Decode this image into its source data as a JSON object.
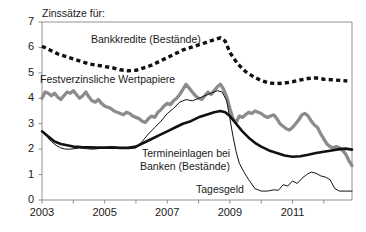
{
  "chart_data": {
    "type": "line",
    "title": "Zinssätze für:",
    "xlabel": "",
    "ylabel": "",
    "xlim": [
      2003.0,
      2012.9
    ],
    "ylim": [
      0,
      7
    ],
    "yticks": [
      0,
      1,
      2,
      3,
      4,
      5,
      6,
      7
    ],
    "xticks": [
      2003,
      2004,
      2005,
      2006,
      2007,
      2008,
      2009,
      2010,
      2011,
      2012
    ],
    "xtick_labels": [
      "2003",
      "",
      "2005",
      "",
      "2007",
      "",
      "2009",
      "",
      "2011",
      ""
    ],
    "grid": false,
    "legend_position": "inline-annotations",
    "colors": {
      "bankkredite": "#111111",
      "wertpapiere": "#8c8c8c",
      "termineinlagen": "#111111",
      "tagesgeld": "#111111",
      "axis": "#777777",
      "text": "#1a1a1a"
    },
    "series": [
      {
        "name": "Bankkredite (Bestände)",
        "style": "dashed-thick",
        "color": "#111111",
        "x": [
          2003.0,
          2003.25,
          2003.5,
          2003.75,
          2004.0,
          2004.25,
          2004.5,
          2004.75,
          2005.0,
          2005.25,
          2005.5,
          2005.75,
          2006.0,
          2006.25,
          2006.5,
          2006.75,
          2007.0,
          2007.25,
          2007.5,
          2007.75,
          2008.0,
          2008.25,
          2008.5,
          2008.7,
          2008.85,
          2009.0,
          2009.25,
          2009.5,
          2009.75,
          2010.0,
          2010.25,
          2010.5,
          2010.75,
          2011.0,
          2011.25,
          2011.5,
          2011.75,
          2012.0,
          2012.35,
          2012.75
        ],
        "y": [
          6.05,
          5.9,
          5.75,
          5.65,
          5.55,
          5.45,
          5.35,
          5.3,
          5.25,
          5.2,
          5.12,
          5.08,
          5.1,
          5.2,
          5.3,
          5.45,
          5.6,
          5.75,
          5.9,
          6.0,
          6.1,
          6.2,
          6.3,
          6.38,
          6.25,
          5.8,
          5.35,
          5.05,
          4.85,
          4.7,
          4.6,
          4.58,
          4.6,
          4.65,
          4.72,
          4.78,
          4.8,
          4.75,
          4.72,
          4.68
        ]
      },
      {
        "name": "Festverzinsliche Wertpapiere",
        "style": "solid-thick-gray",
        "color": "#8c8c8c",
        "x": [
          2003.0,
          2003.1,
          2003.2,
          2003.3,
          2003.4,
          2003.5,
          2003.6,
          2003.7,
          2003.8,
          2003.9,
          2004.0,
          2004.1,
          2004.2,
          2004.3,
          2004.4,
          2004.5,
          2004.6,
          2004.7,
          2004.8,
          2004.9,
          2005.0,
          2005.1,
          2005.2,
          2005.3,
          2005.4,
          2005.5,
          2005.6,
          2005.7,
          2005.8,
          2005.9,
          2006.0,
          2006.1,
          2006.2,
          2006.3,
          2006.4,
          2006.5,
          2006.6,
          2006.7,
          2006.8,
          2006.9,
          2007.0,
          2007.1,
          2007.2,
          2007.3,
          2007.4,
          2007.5,
          2007.6,
          2007.7,
          2007.8,
          2007.9,
          2008.0,
          2008.1,
          2008.2,
          2008.3,
          2008.4,
          2008.5,
          2008.6,
          2008.7,
          2008.8,
          2008.9,
          2009.0,
          2009.1,
          2009.2,
          2009.3,
          2009.4,
          2009.5,
          2009.6,
          2009.7,
          2009.8,
          2009.9,
          2010.0,
          2010.1,
          2010.2,
          2010.3,
          2010.4,
          2010.5,
          2010.6,
          2010.7,
          2010.8,
          2010.9,
          2011.0,
          2011.1,
          2011.2,
          2011.3,
          2011.4,
          2011.5,
          2011.6,
          2011.7,
          2011.8,
          2011.9,
          2012.0,
          2012.1,
          2012.2,
          2012.3,
          2012.4,
          2012.5,
          2012.6,
          2012.7,
          2012.8,
          2012.9
        ],
        "y": [
          4.0,
          4.25,
          4.2,
          4.1,
          4.2,
          4.05,
          3.95,
          4.1,
          4.25,
          4.2,
          4.3,
          4.15,
          4.0,
          4.1,
          4.25,
          4.05,
          3.9,
          3.85,
          3.95,
          3.8,
          3.7,
          3.65,
          3.6,
          3.5,
          3.45,
          3.4,
          3.35,
          3.45,
          3.4,
          3.3,
          3.25,
          3.2,
          3.1,
          3.05,
          3.2,
          3.3,
          3.25,
          3.45,
          3.55,
          3.7,
          3.8,
          3.75,
          3.9,
          4.0,
          4.15,
          4.35,
          4.55,
          4.4,
          4.25,
          4.1,
          4.0,
          3.95,
          4.1,
          4.25,
          4.15,
          4.3,
          4.45,
          4.55,
          4.35,
          4.05,
          3.6,
          3.2,
          3.05,
          3.3,
          3.25,
          3.35,
          3.45,
          3.4,
          3.5,
          3.45,
          3.4,
          3.3,
          3.25,
          3.3,
          3.35,
          3.2,
          3.0,
          2.9,
          2.8,
          2.75,
          2.85,
          3.0,
          3.15,
          3.35,
          3.4,
          3.3,
          3.1,
          2.95,
          2.85,
          2.6,
          2.4,
          2.2,
          2.1,
          2.05,
          2.1,
          2.05,
          1.95,
          1.8,
          1.55,
          1.35
        ]
      },
      {
        "name": "Termineinlagen bei Banken (Bestände)",
        "style": "solid-thick-black",
        "color": "#111111",
        "x": [
          2003.0,
          2003.2,
          2003.4,
          2003.6,
          2003.8,
          2004.0,
          2004.25,
          2004.5,
          2004.75,
          2005.0,
          2005.25,
          2005.5,
          2005.75,
          2006.0,
          2006.25,
          2006.5,
          2006.75,
          2007.0,
          2007.25,
          2007.5,
          2007.75,
          2008.0,
          2008.25,
          2008.5,
          2008.7,
          2008.85,
          2009.0,
          2009.2,
          2009.4,
          2009.6,
          2009.8,
          2010.0,
          2010.25,
          2010.5,
          2010.75,
          2011.0,
          2011.25,
          2011.5,
          2011.75,
          2012.0,
          2012.25,
          2012.5,
          2012.7,
          2012.9
        ],
        "y": [
          2.7,
          2.5,
          2.3,
          2.2,
          2.15,
          2.1,
          2.08,
          2.07,
          2.06,
          2.06,
          2.07,
          2.05,
          2.05,
          2.1,
          2.25,
          2.4,
          2.55,
          2.7,
          2.85,
          3.0,
          3.1,
          3.25,
          3.35,
          3.45,
          3.5,
          3.45,
          3.3,
          3.0,
          2.7,
          2.45,
          2.25,
          2.1,
          1.95,
          1.85,
          1.75,
          1.7,
          1.72,
          1.78,
          1.85,
          1.9,
          1.95,
          2.0,
          2.02,
          1.98
        ]
      },
      {
        "name": "Tagesgeld",
        "style": "solid-thin-black",
        "color": "#111111",
        "x": [
          2003.0,
          2003.15,
          2003.3,
          2003.45,
          2003.6,
          2003.75,
          2003.9,
          2004.05,
          2004.2,
          2004.4,
          2004.6,
          2004.8,
          2005.0,
          2005.2,
          2005.4,
          2005.6,
          2005.8,
          2006.0,
          2006.2,
          2006.4,
          2006.6,
          2006.8,
          2007.0,
          2007.2,
          2007.4,
          2007.6,
          2007.8,
          2008.0,
          2008.2,
          2008.4,
          2008.6,
          2008.75,
          2008.9,
          2009.0,
          2009.1,
          2009.2,
          2009.3,
          2009.45,
          2009.6,
          2009.8,
          2010.0,
          2010.2,
          2010.4,
          2010.55,
          2010.7,
          2010.85,
          2011.0,
          2011.15,
          2011.3,
          2011.45,
          2011.6,
          2011.75,
          2011.9,
          2012.05,
          2012.2,
          2012.35,
          2012.5,
          2012.7,
          2012.9
        ],
        "y": [
          2.7,
          2.5,
          2.3,
          2.15,
          2.05,
          2.0,
          2.0,
          2.02,
          2.05,
          2.02,
          2.0,
          2.02,
          2.05,
          2.05,
          2.04,
          2.03,
          2.02,
          2.05,
          2.3,
          2.6,
          2.85,
          3.1,
          3.4,
          3.6,
          3.85,
          3.95,
          3.9,
          4.0,
          4.1,
          4.2,
          4.3,
          4.25,
          3.9,
          3.2,
          2.5,
          1.9,
          1.45,
          1.1,
          0.8,
          0.45,
          0.35,
          0.35,
          0.4,
          0.38,
          0.6,
          0.55,
          0.75,
          0.65,
          0.85,
          1.0,
          1.1,
          1.05,
          0.95,
          0.9,
          0.8,
          0.45,
          0.35,
          0.35,
          0.35
        ]
      }
    ],
    "annotations": [
      {
        "text": "Bankkredite (Bestände)",
        "x_px": 91,
        "y_px": 33
      },
      {
        "text": "Festverzinsliche Wertpapiere",
        "x_px": 40,
        "y_px": 73
      },
      {
        "text": "Termineinlagen bei",
        "x_px": 142,
        "y_px": 147
      },
      {
        "text": "Banken (Bestände)",
        "x_px": 140,
        "y_px": 160
      },
      {
        "text": "Tagesgeld",
        "x_px": 196,
        "y_px": 183
      }
    ]
  }
}
